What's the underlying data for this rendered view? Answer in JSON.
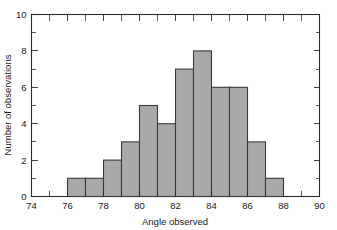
{
  "chart_data": {
    "type": "bar",
    "title": "",
    "subtitle": "",
    "xlabel": "Angle observed",
    "ylabel": "Number of observations",
    "xlim": [
      74,
      90
    ],
    "ylim": [
      0,
      10
    ],
    "grid": false,
    "legend": null,
    "bin_width": 1,
    "bin_edges": [
      76,
      77,
      78,
      79,
      80,
      81,
      82,
      83,
      84,
      85,
      86,
      87,
      88
    ],
    "categories": [
      "76-77",
      "77-78",
      "78-79",
      "79-80",
      "80-81",
      "81-82",
      "82-83",
      "83-84",
      "84-85",
      "85-86",
      "86-87",
      "87-88"
    ],
    "values": [
      1,
      1,
      2,
      3,
      5,
      4,
      7,
      8,
      6,
      6,
      3,
      1
    ],
    "x_ticks_major": [
      74,
      76,
      78,
      80,
      82,
      84,
      86,
      88,
      90
    ],
    "x_ticks_major_labels": [
      "74",
      "76",
      "78",
      "80",
      "82",
      "84",
      "86",
      "88",
      "90"
    ],
    "x_ticks_minor": [
      75,
      77,
      79,
      81,
      83,
      85,
      87,
      89
    ],
    "y_ticks_major": [
      0,
      2,
      4,
      6,
      8,
      10
    ],
    "y_ticks_major_labels": [
      "0",
      "2",
      "4",
      "6",
      "8",
      "10"
    ],
    "y_ticks_minor": [
      1,
      3,
      5,
      7,
      9
    ],
    "colors": {
      "bar_fill": "#a9a9a9",
      "bar_edge": "#3a3a3a",
      "axis": "#2b2b2b",
      "text": "#1a1a1a",
      "background": "#ffffff"
    }
  }
}
